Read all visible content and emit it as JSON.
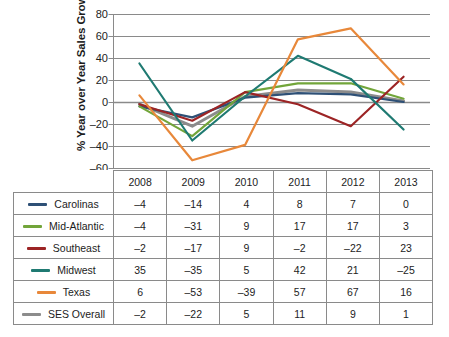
{
  "chart_data": {
    "type": "line",
    "title": "",
    "xlabel": "",
    "ylabel": "% Year over Year Sales Growth",
    "ylim": [
      -60,
      80
    ],
    "ytick_step": 20,
    "yticks": [
      "80",
      "60",
      "40",
      "20",
      "0",
      "-20",
      "-40",
      "-60"
    ],
    "grid": true,
    "legend_position": "table-left-column",
    "categories": [
      "2008",
      "2009",
      "2010",
      "2011",
      "2012",
      "2013"
    ],
    "series": [
      {
        "name": "Carolinas",
        "color": "#2e5076",
        "values": [
          -4,
          -14,
          4,
          8,
          7,
          0
        ]
      },
      {
        "name": "Mid-Atlantic",
        "color": "#72a53a",
        "values": [
          -4,
          -31,
          9,
          17,
          17,
          3
        ]
      },
      {
        "name": "Southeast",
        "color": "#9c2425",
        "values": [
          -2,
          -17,
          9,
          -2,
          -22,
          23
        ]
      },
      {
        "name": "Midwest",
        "color": "#1f7a72",
        "values": [
          35,
          -35,
          5,
          42,
          21,
          -25
        ]
      },
      {
        "name": "Texas",
        "color": "#e8883a",
        "values": [
          6,
          -53,
          -39,
          57,
          67,
          16
        ]
      },
      {
        "name": "SES Overall",
        "color": "#8c8c8c",
        "values": [
          -2,
          -22,
          5,
          11,
          9,
          1
        ]
      }
    ]
  },
  "table": {
    "header_corner": "",
    "columns": [
      "2008",
      "2009",
      "2010",
      "2011",
      "2012",
      "2013"
    ],
    "rows": [
      {
        "label": "Carolinas",
        "color": "#2e5076",
        "cells": [
          "–4",
          "–14",
          "4",
          "8",
          "7",
          "0"
        ]
      },
      {
        "label": "Mid-Atlantic",
        "color": "#72a53a",
        "cells": [
          "–4",
          "–31",
          "9",
          "17",
          "17",
          "3"
        ]
      },
      {
        "label": "Southeast",
        "color": "#9c2425",
        "cells": [
          "–2",
          "–17",
          "9",
          "–2",
          "–22",
          "23"
        ]
      },
      {
        "label": "Midwest",
        "color": "#1f7a72",
        "cells": [
          "35",
          "–35",
          "5",
          "42",
          "21",
          "–25"
        ]
      },
      {
        "label": "Texas",
        "color": "#e8883a",
        "cells": [
          "6",
          "–53",
          "–39",
          "57",
          "67",
          "16"
        ]
      },
      {
        "label": "SES Overall",
        "color": "#8c8c8c",
        "cells": [
          "–2",
          "–22",
          "5",
          "11",
          "9",
          "1"
        ]
      }
    ]
  },
  "axis": {
    "title": "% Year over Year Sales Growth",
    "ticks": [
      "80",
      "60",
      "40",
      "20",
      "0",
      "–20",
      "–40",
      "–60"
    ]
  },
  "colors": {
    "gridline": "#8a8a8a",
    "zero_line": "#8a8a8a",
    "table_border": "#8a8a8a",
    "text": "#1c1c1c",
    "background": "#ffffff"
  }
}
